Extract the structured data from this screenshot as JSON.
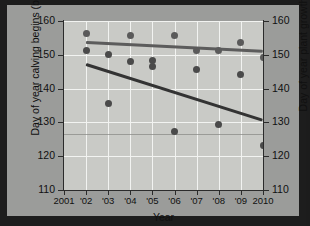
{
  "chart_data": {
    "type": "scatter",
    "title": "",
    "xlabel": "Year",
    "ylabel_left": "Day of year calving begins (blue)",
    "ylabel_right": "Day of year plant growth begins (red)",
    "x": [
      2001,
      2002,
      2003,
      2004,
      2005,
      2006,
      2007,
      2008,
      2009,
      2010
    ],
    "xtick_labels": [
      "2001",
      "'02",
      "'03",
      "'04",
      "'05",
      "'06",
      "'07",
      "'08",
      "'09",
      "2010"
    ],
    "ytick_labels_left": [
      "110",
      "120",
      "130",
      "140",
      "150",
      "160"
    ],
    "ytick_labels_right": [
      "110",
      "120",
      "130",
      "140",
      "150",
      "160"
    ],
    "ylim_left": [
      110,
      160
    ],
    "ylim_right": [
      110,
      160
    ],
    "xlim": [
      2001,
      2010
    ],
    "grid": true,
    "legend": "none (encoded in axis titles)",
    "series": [
      {
        "name": "Day of year plant growth begins (red)",
        "color": "#5a5a5a",
        "marker": "circle",
        "points": [
          {
            "x": 2002,
            "y": 156.2
          },
          {
            "x": 2004,
            "y": 155.6
          },
          {
            "x": 2006,
            "y": 155.6
          },
          {
            "x": 2007,
            "y": 151.2
          },
          {
            "x": 2008,
            "y": 151.2
          },
          {
            "x": 2009,
            "y": 153.6
          },
          {
            "x": 2010,
            "y": 149.3
          }
        ]
      },
      {
        "name": "Day of year calving begins (blue)",
        "color": "#4a4a4a",
        "marker": "circle",
        "points": [
          {
            "x": 2002,
            "y": 151.4
          },
          {
            "x": 2003,
            "y": 150.2
          },
          {
            "x": 2003,
            "y": 135.6
          },
          {
            "x": 2004,
            "y": 148.1
          },
          {
            "x": 2005,
            "y": 148.4
          },
          {
            "x": 2005,
            "y": 146.4
          },
          {
            "x": 2006,
            "y": 127.3
          },
          {
            "x": 2007,
            "y": 145.6
          },
          {
            "x": 2008,
            "y": 129.3
          },
          {
            "x": 2009,
            "y": 144.3
          },
          {
            "x": 2010,
            "y": 123.3
          }
        ]
      }
    ],
    "trend_lines": [
      {
        "name": "plant-growth-trend",
        "color": "#5c5c5c",
        "x_start": 2002,
        "y_start": 153.6,
        "x_end": 2010,
        "y_end": 151.0,
        "width": 3
      },
      {
        "name": "calving-trend",
        "color": "#333333",
        "x_start": 2002,
        "y_start": 147.1,
        "x_end": 2010,
        "y_end": 130.6,
        "width": 3
      }
    ],
    "reference_line": {
      "name": "faint-horizontal-reference",
      "y": 126.5,
      "color": "#8a8b87"
    },
    "colors": {
      "plot_background": "#c9cac6",
      "card_background": "#9b9c9a",
      "frame": "#1d1d1d",
      "gridline": "#f2f3f1",
      "axis": "#2b2b2b",
      "text": "#101010"
    }
  }
}
